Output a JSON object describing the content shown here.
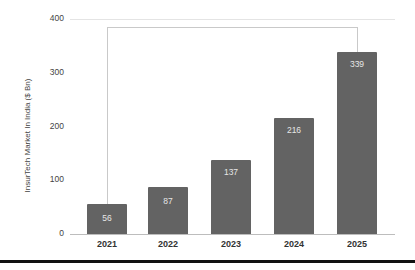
{
  "chart_data": {
    "type": "bar",
    "title": "",
    "xlabel": "",
    "ylabel": "InsurTech Market In India ($ Bn)",
    "categories": [
      "2021",
      "2022",
      "2023",
      "2024",
      "2025"
    ],
    "values": [
      56,
      87,
      137,
      216,
      339
    ],
    "ylim": [
      0,
      400
    ],
    "yticks": [
      0,
      100,
      200,
      300,
      400
    ],
    "grid": "horizontal-top-only",
    "legend": "none",
    "annotations": [
      "bracket connecting 2021 bar to 2025 bar"
    ],
    "colors": {
      "bar": "#636363",
      "bar_label": "#e6e6e6",
      "axis_text": "#444444",
      "bracket": "#c9c9c9"
    }
  }
}
